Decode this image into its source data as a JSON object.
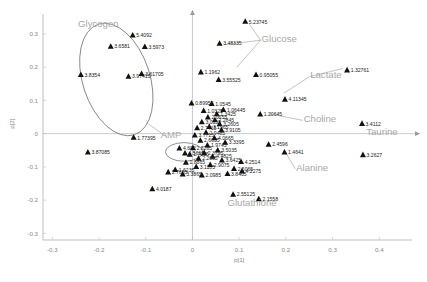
{
  "chart_data": {
    "type": "scatter",
    "title": "",
    "xlabel": "p[1]",
    "ylabel": "p[2]",
    "xlim": [
      -0.32,
      0.47
    ],
    "ylim": [
      -0.32,
      0.36
    ],
    "xticks": [
      "-0.3",
      "-0.2",
      "-0.1",
      "0",
      "0.1",
      "0.2",
      "0.3",
      "0.4"
    ],
    "xtick_values": [
      -0.3,
      -0.2,
      -0.1,
      0,
      0.1,
      0.2,
      0.3,
      0.4
    ],
    "yticks": [
      "0.3",
      "0.2",
      "0.1",
      "0",
      "-0.1",
      "-0.2",
      "-0.3"
    ],
    "ytick_values": [
      0.3,
      0.2,
      0.1,
      0,
      -0.1,
      -0.2,
      -0.3
    ],
    "grid": false,
    "legend": "none",
    "marker": "triangle",
    "marker_color": "#111111",
    "annotations": [
      {
        "text": "Glycogen",
        "x": -0.245,
        "y": 0.322
      },
      {
        "text": "Glucose",
        "x": 0.148,
        "y": 0.277
      },
      {
        "text": "Lactate",
        "x": 0.252,
        "y": 0.167
      },
      {
        "text": "Choline",
        "x": 0.238,
        "y": 0.034
      },
      {
        "text": "Taurine",
        "x": 0.372,
        "y": -0.005
      },
      {
        "text": "AMP",
        "x": -0.068,
        "y": -0.014
      },
      {
        "text": "Alanine",
        "x": 0.222,
        "y": -0.113
      },
      {
        "text": "Glutathione",
        "x": 0.075,
        "y": -0.218
      }
    ],
    "ellipses": [
      {
        "name": "glycogen-ellipse",
        "cx": -0.163,
        "cy": 0.163,
        "rx": 0.072,
        "ry": 0.175,
        "rotation": -18
      },
      {
        "name": "amp-ellipse",
        "cx": -0.018,
        "cy": -0.055,
        "rx": 0.04,
        "ry": 0.028,
        "rotation": 0
      }
    ],
    "points": [
      {
        "label": "5.4092",
        "x": -0.128,
        "y": 0.297
      },
      {
        "label": "3.6581",
        "x": -0.175,
        "y": 0.263
      },
      {
        "label": "3.5973",
        "x": -0.102,
        "y": 0.262
      },
      {
        "label": "5.23745",
        "x": 0.113,
        "y": 0.338
      },
      {
        "label": "3.48335",
        "x": 0.058,
        "y": 0.272
      },
      {
        "label": "3.8354",
        "x": -0.239,
        "y": 0.178
      },
      {
        "label": "3.97415",
        "x": -0.137,
        "y": 0.173
      },
      {
        "label": "3.61705",
        "x": -0.109,
        "y": 0.181
      },
      {
        "label": "1.1962",
        "x": 0.018,
        "y": 0.186
      },
      {
        "label": "3.55525",
        "x": 0.056,
        "y": 0.163
      },
      {
        "label": "0.95055",
        "x": 0.136,
        "y": 0.178
      },
      {
        "label": "1.32761",
        "x": 0.331,
        "y": 0.192
      },
      {
        "label": "4.11345",
        "x": 0.198,
        "y": 0.104
      },
      {
        "label": "1.20645",
        "x": 0.145,
        "y": 0.059
      },
      {
        "label": "3.4112",
        "x": 0.363,
        "y": 0.031
      },
      {
        "label": "3.2627",
        "x": 0.365,
        "y": -0.063
      },
      {
        "label": "1.4641",
        "x": 0.197,
        "y": -0.055
      },
      {
        "label": "2.4596",
        "x": 0.163,
        "y": -0.032
      },
      {
        "label": "1.77395",
        "x": -0.126,
        "y": -0.011
      },
      {
        "label": "3.87085",
        "x": -0.224,
        "y": -0.055
      },
      {
        "label": "4.602",
        "x": -0.028,
        "y": -0.043
      },
      {
        "label": "4.5617",
        "x": -0.016,
        "y": -0.058
      },
      {
        "label": "4.0187",
        "x": -0.086,
        "y": -0.166
      },
      {
        "label": "4.2514",
        "x": 0.104,
        "y": -0.084
      },
      {
        "label": "2.55125",
        "x": 0.087,
        "y": -0.182
      },
      {
        "label": "2.1558",
        "x": 0.142,
        "y": -0.196
      },
      {
        "label": "0.89955",
        "x": -0.002,
        "y": 0.092
      },
      {
        "label": "1.0545",
        "x": 0.041,
        "y": 0.091
      },
      {
        "label": "1.06445",
        "x": 0.066,
        "y": 0.073
      },
      {
        "label": "1.0325",
        "x": 0.024,
        "y": 0.07
      },
      {
        "label": "1.3425",
        "x": 0.052,
        "y": 0.06
      },
      {
        "label": "2.0655",
        "x": 0.033,
        "y": 0.05
      },
      {
        "label": "2.2845",
        "x": 0.048,
        "y": 0.042
      },
      {
        "label": "3.0155",
        "x": 0.02,
        "y": 0.036
      },
      {
        "label": "3.2605",
        "x": 0.058,
        "y": 0.03
      },
      {
        "label": "3.1965",
        "x": 0.036,
        "y": 0.022
      },
      {
        "label": "2.7415",
        "x": 0.01,
        "y": 0.018
      },
      {
        "label": "3.9105",
        "x": 0.062,
        "y": 0.012
      },
      {
        "label": "2.9485",
        "x": 0.029,
        "y": 0.004
      },
      {
        "label": "3.7715",
        "x": 0.005,
        "y": -0.004
      },
      {
        "label": "4.0665",
        "x": 0.047,
        "y": -0.012
      },
      {
        "label": "2.6635",
        "x": 0.017,
        "y": -0.02
      },
      {
        "label": "3.3395",
        "x": 0.07,
        "y": -0.026
      },
      {
        "label": "1.9745",
        "x": 0.032,
        "y": -0.034
      },
      {
        "label": "2.8285",
        "x": 0.001,
        "y": -0.042
      },
      {
        "label": "3.5035",
        "x": 0.054,
        "y": -0.049
      },
      {
        "label": "2.3795",
        "x": 0.025,
        "y": -0.057
      },
      {
        "label": "1.7085",
        "x": -0.006,
        "y": -0.062
      },
      {
        "label": "4.4825",
        "x": 0.043,
        "y": -0.068
      },
      {
        "label": "2.2035",
        "x": 0.013,
        "y": -0.074
      },
      {
        "label": "3.6425",
        "x": 0.063,
        "y": -0.079
      },
      {
        "label": "1.8865",
        "x": -0.014,
        "y": -0.086
      },
      {
        "label": "2.9075",
        "x": 0.038,
        "y": -0.093
      },
      {
        "label": "3.1185",
        "x": 0.008,
        "y": -0.099
      },
      {
        "label": "2.5065",
        "x": 0.089,
        "y": -0.105
      },
      {
        "label": "4.2275",
        "x": 0.106,
        "y": -0.112
      },
      {
        "label": "3.8405",
        "x": 0.075,
        "y": -0.12
      },
      {
        "label": "2.0985",
        "x": 0.02,
        "y": -0.124
      },
      {
        "label": "1.6235",
        "x": -0.037,
        "y": -0.108
      },
      {
        "label": "2.7655",
        "x": -0.052,
        "y": -0.115
      },
      {
        "label": "3.3865",
        "x": -0.021,
        "y": -0.121
      }
    ]
  }
}
